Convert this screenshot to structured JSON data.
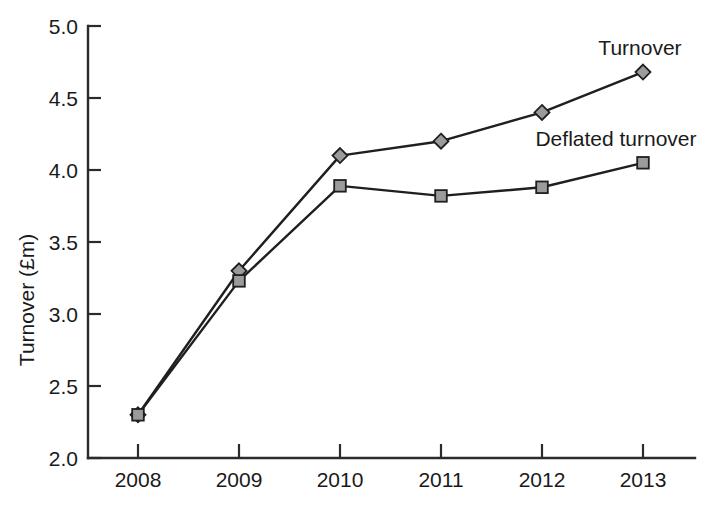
{
  "chart_data": {
    "type": "line",
    "title": "",
    "xlabel": "",
    "ylabel": "Turnover (£m)",
    "categories": [
      "2008",
      "2009",
      "2010",
      "2011",
      "2012",
      "2013"
    ],
    "x": [
      2008,
      2009,
      2010,
      2011,
      2012,
      2013
    ],
    "xlim": [
      2007.5,
      2013.5
    ],
    "ylim": [
      2.0,
      5.0
    ],
    "ytick_labels": [
      "5.0",
      "4.5",
      "4.0",
      "3.5",
      "3.0",
      "2.5",
      "2.0"
    ],
    "yticks": [
      5.0,
      4.5,
      4.0,
      3.5,
      3.0,
      2.5,
      2.0
    ],
    "grid": false,
    "legend_position": "inline-annotations",
    "series": [
      {
        "name": "Turnover",
        "marker": "diamond",
        "color": "#9b9b9b",
        "line_color": "#1f1f1f",
        "values": [
          2.3,
          3.3,
          4.1,
          4.2,
          4.4,
          4.68
        ]
      },
      {
        "name": "Deflated turnover",
        "marker": "square",
        "color": "#9b9b9b",
        "line_color": "#1f1f1f",
        "values": [
          2.3,
          3.23,
          3.89,
          3.82,
          3.88,
          4.05
        ]
      }
    ],
    "annotations": [
      {
        "text": "Turnover",
        "x": 2013.0,
        "y": 4.84,
        "anchor": "middle"
      },
      {
        "text": "Deflated turnover",
        "x": 2012.85,
        "y": 4.21,
        "anchor": "middle"
      }
    ]
  },
  "axes": {
    "y_title": "Turnover (£m)",
    "y_tick_0": "5.0",
    "y_tick_1": "4.5",
    "y_tick_2": "4.0",
    "y_tick_3": "3.5",
    "y_tick_4": "3.0",
    "y_tick_5": "2.5",
    "y_tick_6": "2.0",
    "x_tick_0": "2008",
    "x_tick_1": "2009",
    "x_tick_2": "2010",
    "x_tick_3": "2011",
    "x_tick_4": "2012",
    "x_tick_5": "2013"
  },
  "labels": {
    "turnover": "Turnover",
    "deflated_turnover": "Deflated turnover"
  },
  "colors": {
    "marker_fill": "#9b9b9b",
    "line": "#1f1f1f",
    "axis": "#2b2b2b",
    "text": "#1a1a1a",
    "background": "#ffffff"
  }
}
